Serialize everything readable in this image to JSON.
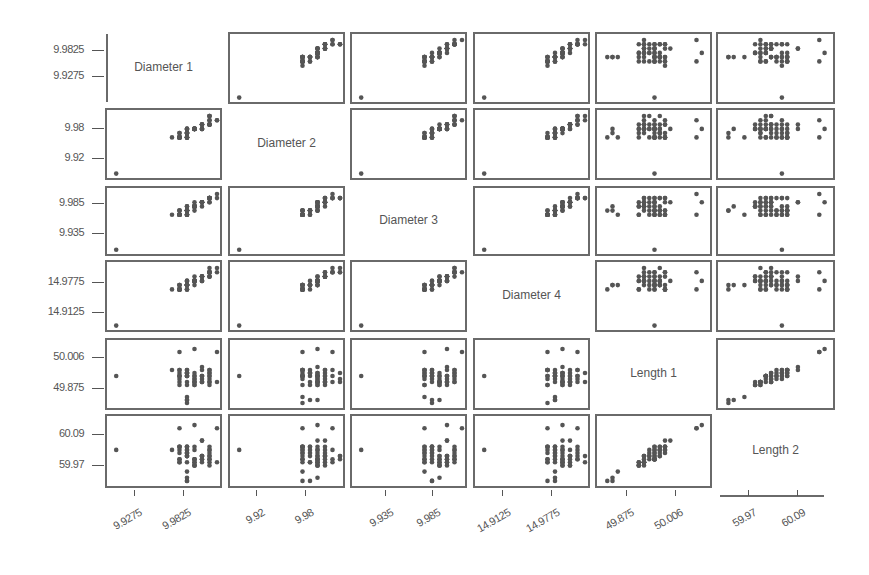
{
  "chart_data": {
    "type": "scatter",
    "variables": [
      "Diameter 1",
      "Diameter 2",
      "Diameter 3",
      "Diameter 4",
      "Length 1",
      "Length 2"
    ],
    "ticks": {
      "Diameter 1": [
        "9.9275",
        "9.9825"
      ],
      "Diameter 2": [
        "9.92",
        "9.98"
      ],
      "Diameter 3": [
        "9.935",
        "9.985"
      ],
      "Diameter 4": [
        "14.9125",
        "14.9775"
      ],
      "Length 1": [
        "49.875",
        "50.006"
      ],
      "Length 2": [
        "59.97",
        "60.09"
      ]
    },
    "y_tick_order_top_to_bottom": {
      "Diameter 1": [
        "9.9825",
        "9.9275"
      ],
      "Diameter 2": [
        "9.98",
        "9.92"
      ],
      "Diameter 3": [
        "9.985",
        "9.935"
      ],
      "Diameter 4": [
        "14.9775",
        "14.9125"
      ],
      "Length 1": [
        "50.006",
        "49.875"
      ],
      "Length 2": [
        "60.09",
        "59.97"
      ]
    },
    "grid": false,
    "legend": null
  },
  "diagonal_labels": [
    "Diameter 1",
    "Diameter 2",
    "Diameter 3",
    "Diameter 4",
    "Length 1",
    "Length 2"
  ],
  "y_axis_labels": [
    [
      "9.9825",
      "9.9275"
    ],
    [
      "9.98",
      "9.92"
    ],
    [
      "9.985",
      "9.935"
    ],
    [
      "14.9775",
      "14.9125"
    ],
    [
      "50.006",
      "49.875"
    ],
    [
      "60.09",
      "59.97"
    ]
  ],
  "x_axis_labels": [
    [
      "9.9275",
      "9.9825"
    ],
    [
      "9.92",
      "9.98"
    ],
    [
      "9.935",
      "9.985"
    ],
    [
      "14.9125",
      "14.9775"
    ],
    [
      "49.875",
      "50.006"
    ],
    [
      "59.97",
      "60.09"
    ]
  ],
  "colors": {
    "point": "#555555",
    "frame": "#6a6a6a",
    "text": "#555555"
  }
}
